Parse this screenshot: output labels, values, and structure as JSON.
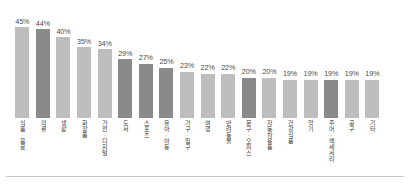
{
  "chart_data": {
    "type": "bar",
    "title": "",
    "subtitle": "",
    "xlabel": "",
    "ylabel": "",
    "ylim": [
      0,
      50
    ],
    "grid": false,
    "legend": "none",
    "value_suffix": "%",
    "categories": [
      "식품·음료",
      "의류",
      "생활",
      "화장품",
      "가전·디지털",
      "도서",
      "스포츠",
      "유아·아동",
      "가구·침구",
      "여행",
      "반려동물",
      "문구·오피스",
      "자동차용품",
      "건강식품",
      "악기",
      "주어·액세서리",
      "공구",
      "기타"
    ],
    "values": [
      45,
      44,
      40,
      35,
      34,
      29,
      27,
      25,
      23,
      22,
      22,
      20,
      20,
      19,
      19,
      19,
      19,
      19
    ],
    "value_labels": [
      "45%",
      "44%",
      "40%",
      "35%",
      "34%",
      "29%",
      "27%",
      "25%",
      "23%",
      "22%",
      "22%",
      "20%",
      "20%",
      "19%",
      "19%",
      "19%",
      "19%",
      "19%"
    ],
    "bar_shades": [
      "light",
      "dark",
      "light",
      "light",
      "light",
      "dark",
      "dark",
      "dark",
      "light",
      "light",
      "light",
      "dark",
      "light",
      "light",
      "light",
      "dark",
      "light",
      "light"
    ],
    "colors": {
      "bar_light": "#bdbdbd",
      "bar_dark": "#8a8a8a",
      "value_text": "#4a4a4a",
      "axis_label_text": "#3c3c3c",
      "rule": "#c8c8c8",
      "background": "#ffffff"
    }
  }
}
